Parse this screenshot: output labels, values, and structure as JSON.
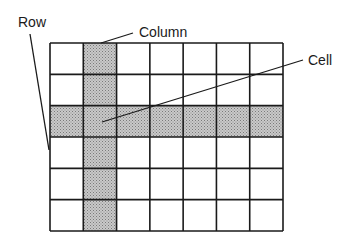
{
  "diagram": {
    "labels": {
      "row": "Row",
      "column": "Column",
      "cell": "Cell"
    },
    "grid": {
      "columns": 7,
      "rows": 6,
      "highlighted_row_index": 2,
      "highlighted_column_index": 1
    },
    "colors": {
      "line": "#1a1a1a",
      "shade": "#b8b8b8",
      "background": "#ffffff"
    }
  }
}
